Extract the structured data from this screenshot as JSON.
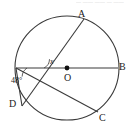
{
  "figure": {
    "type": "circle-geometry-diagram",
    "background_color": "#ffffff",
    "stroke_color": "#3a3a3a",
    "label_color": "#1a1a1a",
    "top_artifact_text": "— —— —— — ——",
    "labels": {
      "point_a": "A",
      "point_b": "B",
      "point_c": "C",
      "point_d": "D",
      "center_o": "O",
      "angle_x": "x",
      "angle_48": "48°"
    },
    "circle": {
      "center_x": 67,
      "center_y": 68,
      "radius": 52
    },
    "points": {
      "A": {
        "x": 84,
        "y": 19
      },
      "B": {
        "x": 118,
        "y": 68
      },
      "C": {
        "x": 98,
        "y": 112
      },
      "D": {
        "x": 22,
        "y": 106
      },
      "O": {
        "x": 67,
        "y": 68
      },
      "L": {
        "x": 16,
        "y": 68
      }
    },
    "segments": [
      {
        "name": "diameter-lb",
        "from": "L",
        "to": "B"
      },
      {
        "name": "chord-da",
        "from": "D",
        "to": "A"
      },
      {
        "name": "chord-lc",
        "from": "L",
        "to": "C"
      },
      {
        "name": "chord-ld",
        "from": "L",
        "to": "D"
      }
    ]
  }
}
